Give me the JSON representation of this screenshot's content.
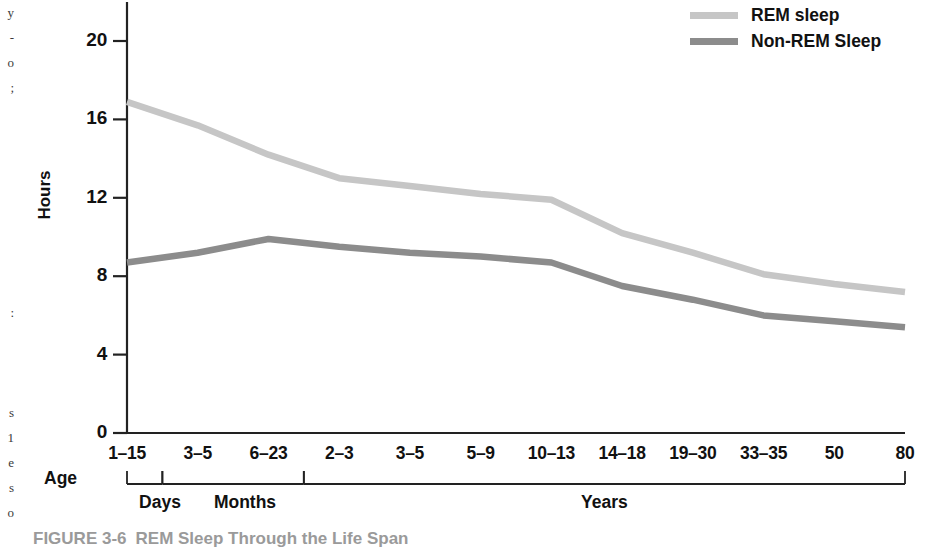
{
  "figure": {
    "caption_number": "FIGURE 3-6",
    "caption_title": "REM Sleep Through the Life Span"
  },
  "axes": {
    "y_title": "Hours",
    "age_label": "Age"
  },
  "colors": {
    "rem_line": "#c6c6c6",
    "nonrem_line": "#8c8c8c",
    "axis": "#222222",
    "text": "#111111",
    "caption": "#9a9a9a"
  },
  "edge_bleed": "y\n-\no\n;\n\n\n\n\n\n\n\n\n:\n\n\n\ns\n1\ne\ns\no\n\ns\n-\no\nf\nc",
  "chart_data": {
    "type": "line",
    "title": "REM Sleep Through the Life Span",
    "xlabel": "Age",
    "ylabel": "Hours",
    "ylim": [
      0,
      22
    ],
    "yticks": [
      0,
      4,
      8,
      12,
      16,
      20
    ],
    "ytick_labels": [
      "0",
      "4",
      "8",
      "12",
      "16",
      "20"
    ],
    "grid": false,
    "legend_position": "top-right",
    "categories": [
      "1–15",
      "3–5",
      "6–23",
      "2–3",
      "3–5",
      "5–9",
      "10–13",
      "14–18",
      "19–30",
      "33–35",
      "50",
      "80"
    ],
    "category_units": [
      "Days",
      "Months",
      "Months",
      "Years",
      "Years",
      "Years",
      "Years",
      "Years",
      "Years",
      "Years",
      "Years",
      "Years"
    ],
    "group_brackets": [
      {
        "label": "Days",
        "start_index": 0,
        "end_index": 0
      },
      {
        "label": "Months",
        "start_index": 1,
        "end_index": 2
      },
      {
        "label": "Years",
        "start_index": 3,
        "end_index": 11
      }
    ],
    "series": [
      {
        "name": "REM sleep",
        "color": "#c6c6c6",
        "values": [
          16.9,
          15.7,
          14.2,
          13.0,
          12.6,
          12.2,
          11.9,
          10.2,
          9.2,
          8.1,
          7.6,
          7.2
        ]
      },
      {
        "name": "Non-REM Sleep",
        "color": "#8c8c8c",
        "values": [
          8.7,
          9.2,
          9.9,
          9.5,
          9.2,
          9.0,
          8.7,
          7.5,
          6.8,
          6.0,
          5.7,
          5.4
        ]
      }
    ]
  }
}
